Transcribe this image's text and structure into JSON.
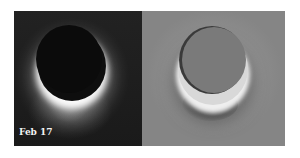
{
  "figure": {
    "left_panel": {
      "description": "dark-field image of occulted disk with bright crescent rim and plume",
      "label": "Feb 17"
    },
    "right_panel": {
      "description": "processed/enhanced grayscale image of same disk showing halo and tail"
    },
    "colors": {
      "left_background": "#1c1c1c",
      "right_background": "#8d8d8d",
      "highlight": "#ffffff"
    }
  }
}
